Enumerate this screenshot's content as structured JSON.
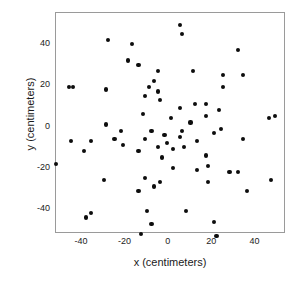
{
  "chart_data": {
    "type": "scatter",
    "title": "",
    "xlabel": "x (centimeters)",
    "ylabel": "y (centimeters)",
    "xlim": [
      -52,
      54
    ],
    "ylim": [
      -52,
      55
    ],
    "xticks": [
      -40,
      -20,
      0,
      20,
      40
    ],
    "yticks": [
      -40,
      -20,
      0,
      20,
      40
    ],
    "xtick_labels": [
      "-40",
      "-20",
      "0",
      "20",
      "40"
    ],
    "ytick_labels": [
      "-40",
      "-20",
      "0",
      "20",
      "40"
    ],
    "grid": false,
    "legend": null,
    "marker": "filled-circle",
    "marker_color": "#0d0d0d",
    "frame_color": "#9a9a9a",
    "background": "#ffffff",
    "n_points": 75,
    "series": [
      {
        "name": "observations",
        "points": [
          [
            -28,
            42
          ],
          [
            -17,
            40
          ],
          [
            -19,
            32
          ],
          [
            -14,
            30
          ],
          [
            -5,
            27
          ],
          [
            -46,
            19
          ],
          [
            -44,
            19
          ],
          [
            -29,
            18
          ],
          [
            -9,
            19
          ],
          [
            -5,
            17
          ],
          [
            -11,
            15
          ],
          [
            -12,
            6
          ],
          [
            -29,
            1
          ],
          [
            -22,
            -2
          ],
          [
            -8,
            -2
          ],
          [
            5,
            49
          ],
          [
            6,
            45
          ],
          [
            32,
            37
          ],
          [
            11,
            27
          ],
          [
            25,
            25
          ],
          [
            34,
            25
          ],
          [
            25,
            19
          ],
          [
            5,
            9
          ],
          [
            12,
            11
          ],
          [
            17,
            11
          ],
          [
            23,
            8
          ],
          [
            17,
            5
          ],
          [
            6,
            -2
          ],
          [
            46,
            4
          ],
          [
            49,
            5
          ],
          [
            -45,
            -7
          ],
          [
            -36,
            -7
          ],
          [
            -25,
            -6
          ],
          [
            -21,
            -9
          ],
          [
            -11,
            -6
          ],
          [
            -39,
            -12
          ],
          [
            -14,
            -12
          ],
          [
            -5,
            -10
          ],
          [
            -3,
            -15
          ],
          [
            -52,
            -18
          ],
          [
            -30,
            -26
          ],
          [
            -11,
            -25
          ],
          [
            -4,
            -27
          ],
          [
            -7,
            -29
          ],
          [
            -14,
            -31
          ],
          [
            -36,
            -42
          ],
          [
            -38,
            -44
          ],
          [
            -10,
            -41
          ],
          [
            -8,
            -47
          ],
          [
            -13,
            -52
          ],
          [
            5,
            -5
          ],
          [
            13,
            -7
          ],
          [
            34,
            -6
          ],
          [
            2,
            -11
          ],
          [
            7,
            -10
          ],
          [
            17,
            -14
          ],
          [
            2,
            -20
          ],
          [
            13,
            -21
          ],
          [
            18,
            -19
          ],
          [
            28,
            -22
          ],
          [
            32,
            -22
          ],
          [
            47,
            -26
          ],
          [
            18,
            -27
          ],
          [
            36,
            -31
          ],
          [
            8,
            -41
          ],
          [
            21,
            -46
          ],
          [
            22,
            -53
          ],
          [
            -4,
            13
          ],
          [
            -7,
            22
          ],
          [
            1,
            4
          ],
          [
            -2,
            -4
          ],
          [
            10,
            2
          ],
          [
            -1,
            -8
          ],
          [
            21,
            -3
          ],
          [
            24,
            -1
          ]
        ]
      }
    ]
  },
  "axes": {
    "x": {
      "ticks": [
        {
          "label": "-40",
          "value": -40
        },
        {
          "label": "-20",
          "value": -20
        },
        {
          "label": "0",
          "value": 0
        },
        {
          "label": "20",
          "value": 20
        },
        {
          "label": "40",
          "value": 40
        }
      ],
      "title": "x (centimeters)"
    },
    "y": {
      "ticks": [
        {
          "label": "40",
          "value": 40
        },
        {
          "label": "20",
          "value": 20
        },
        {
          "label": "0",
          "value": 0
        },
        {
          "label": "-20",
          "value": -20
        },
        {
          "label": "-40",
          "value": -40
        }
      ],
      "title": "y (centimeters)"
    }
  }
}
